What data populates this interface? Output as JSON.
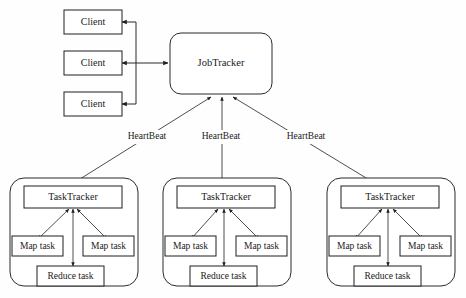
{
  "diagram": {
    "background_color": "#fefefe",
    "line_color": "#2a2a2a",
    "text_color": "#1a1a1a",
    "clients": [
      {
        "label": "Client"
      },
      {
        "label": "Client"
      },
      {
        "label": "Client"
      }
    ],
    "jobtracker": {
      "label": "JobTracker"
    },
    "heartbeats": [
      {
        "label": "HeartBeat"
      },
      {
        "label": "HeartBeat"
      },
      {
        "label": "HeartBeat"
      }
    ],
    "tasktrackers": [
      {
        "label": "TaskTracker",
        "map_task_left": "Map task",
        "map_task_right": "Map task",
        "reduce_task": "Reduce task"
      },
      {
        "label": "TaskTracker",
        "map_task_left": "Map task",
        "map_task_right": "Map task",
        "reduce_task": "Reduce task"
      },
      {
        "label": "TaskTracker",
        "map_task_left": "Map task",
        "map_task_right": "Map task",
        "reduce_task": "Reduce task"
      }
    ]
  }
}
